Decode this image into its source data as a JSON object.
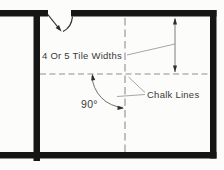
{
  "labels": {
    "tile_widths": "4 Or 5 Tile Widths",
    "chalk_lines": "Chalk Lines",
    "angle": "90°"
  },
  "colors": {
    "background": "#fcfcfa",
    "wall": "#161616",
    "chalk_line": "#8f8f8f",
    "leader": "#909090",
    "dimension": "#707070",
    "arrow": "#2e2e2e",
    "door": "#2a2a2a",
    "text": "#3a3a3a"
  }
}
